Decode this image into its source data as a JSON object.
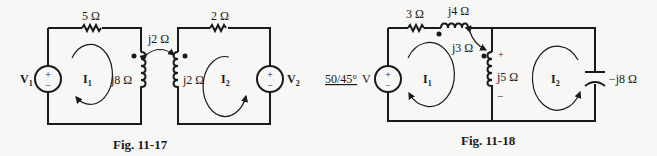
{
  "figures": [
    {
      "caption": "Fig. 11-17",
      "labels": {
        "r1": "5 Ω",
        "r2": "2 Ω",
        "mutual": "j2 Ω",
        "l1": "j8 Ω",
        "l2": "j2 Ω",
        "v1": "V",
        "v1_sub": "1",
        "v2": "V",
        "v2_sub": "2",
        "i1": "I",
        "i1_sub": "1",
        "i2": "I",
        "i2_sub": "2",
        "plus": "+",
        "minus": "−"
      }
    },
    {
      "caption": "Fig. 11-18",
      "labels": {
        "r1": "3 Ω",
        "l1": "j4 Ω",
        "mutual": "j3 Ω",
        "l2": "j5 Ω",
        "cap": "−j8 Ω",
        "source_mag": "50/45°",
        "source_unit": "V",
        "i1": "I",
        "i1_sub": "1",
        "i2": "I",
        "i2_sub": "2",
        "plus": "+",
        "minus": "−",
        "minus_src": "−"
      }
    }
  ]
}
